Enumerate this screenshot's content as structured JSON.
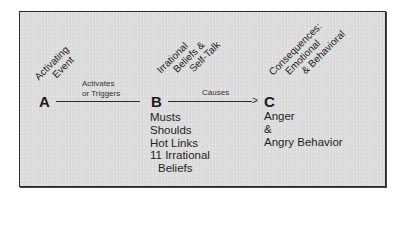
{
  "diagram": {
    "type": "ABC model flow",
    "nodes": [
      {
        "id": "A",
        "letter": "A",
        "heading_lines": [
          "Activating",
          "Event"
        ]
      },
      {
        "id": "B",
        "letter": "B",
        "heading_lines": [
          "Irrational",
          "Beliefs &",
          "Self-Talk"
        ],
        "items": [
          "Musts",
          "Shoulds",
          "Hot Links",
          "11 Irrational",
          "Beliefs"
        ]
      },
      {
        "id": "C",
        "letter": "C",
        "heading_lines": [
          "Consequences:",
          "Emotional",
          "& Behavioral"
        ],
        "items": [
          "Anger",
          "&",
          "Angry Behavior"
        ]
      }
    ],
    "edges": [
      {
        "from": "A",
        "to": "B",
        "label_lines": [
          "Activates",
          "or Triggers"
        ],
        "arrowhead": false
      },
      {
        "from": "B",
        "to": "C",
        "label_lines": [
          "Causes"
        ],
        "arrowhead": true,
        "arrow_glyph": ">"
      }
    ],
    "colors": {
      "panel_background": "#dcdcdc",
      "border": "#2a2a2a",
      "text": "#1a1a1a"
    }
  }
}
